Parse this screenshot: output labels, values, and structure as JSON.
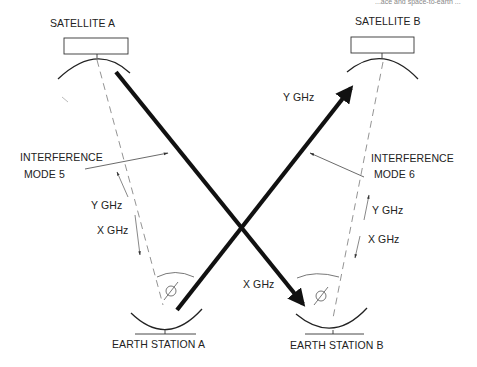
{
  "header": {
    "partial_caption": "...ace and space-to-earth ..."
  },
  "satellites": [
    {
      "id": "A",
      "label": "SATELLITE A"
    },
    {
      "id": "B",
      "label": "SATELLITE B"
    }
  ],
  "earth_stations": [
    {
      "id": "A",
      "label": "EARTH STATION A"
    },
    {
      "id": "B",
      "label": "EARTH STATION B"
    }
  ],
  "links": {
    "uplink_a_to_sat_b": {
      "label": "Y GHz"
    },
    "downlink_sat_a_to_b": {
      "label": "X GHz"
    }
  },
  "interference": [
    {
      "mode": "INTERFERENCE",
      "mode_line2": "MODE 5",
      "up_label": "Y GHz",
      "down_label": "X GHz"
    },
    {
      "mode": "INTERFERENCE",
      "mode_line2": "MODE 6",
      "up_label": "Y GHz",
      "down_label": "X GHz"
    }
  ],
  "colors": {
    "stroke": "#111111",
    "dashed": "#777777",
    "text": "#222222"
  }
}
